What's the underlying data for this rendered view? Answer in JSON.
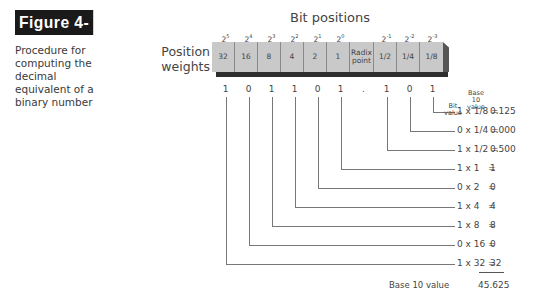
{
  "figure": {
    "label": "Figure 4-4",
    "caption": "Procedure for computing the decimal equivalent of a binary number"
  },
  "diagram": {
    "title": "Bit positions",
    "row_label": "Position weights",
    "columns": [
      {
        "exponent_base": "2",
        "exponent": "5",
        "weight": "32",
        "bit": "1"
      },
      {
        "exponent_base": "2",
        "exponent": "4",
        "weight": "16",
        "bit": "0"
      },
      {
        "exponent_base": "2",
        "exponent": "3",
        "weight": "8",
        "bit": "1"
      },
      {
        "exponent_base": "2",
        "exponent": "2",
        "weight": "4",
        "bit": "1"
      },
      {
        "exponent_base": "2",
        "exponent": "1",
        "weight": "2",
        "bit": "0"
      },
      {
        "exponent_base": "2",
        "exponent": "0",
        "weight": "1",
        "bit": "1"
      },
      {
        "exponent_base": "",
        "exponent": "",
        "weight": "Radix point",
        "bit": "."
      },
      {
        "exponent_base": "2",
        "exponent": "-1",
        "weight": "1/2",
        "bit": "1"
      },
      {
        "exponent_base": "2",
        "exponent": "-2",
        "weight": "1/4",
        "bit": "0"
      },
      {
        "exponent_base": "2",
        "exponent": "-3",
        "weight": "1/8",
        "bit": "1"
      }
    ],
    "headers": {
      "bit_value": "Bit value",
      "base10_value": "Base 10 value"
    },
    "computations": [
      {
        "expr": "1 x 1/8 =",
        "result": "0.125"
      },
      {
        "expr": "0 x 1/4 =",
        "result": "0.000"
      },
      {
        "expr": "1 x 1/2 =",
        "result": "0.500"
      },
      {
        "expr": "1 x 1   =",
        "result": "1"
      },
      {
        "expr": "0 x 2   =",
        "result": "0"
      },
      {
        "expr": "1 x 4   =",
        "result": "4"
      },
      {
        "expr": "1 x 8   =",
        "result": "8"
      },
      {
        "expr": "0 x 16 =",
        "result": "0"
      },
      {
        "expr": "1 x 32 =",
        "result": "32"
      }
    ],
    "total_label": "Base 10 value",
    "total_value": "45.625"
  },
  "colors": {
    "cell_fill": "#c9c9c9",
    "shadow": "#2e2e2e",
    "label_bg": "#1a1a1a",
    "line": "#777777"
  }
}
